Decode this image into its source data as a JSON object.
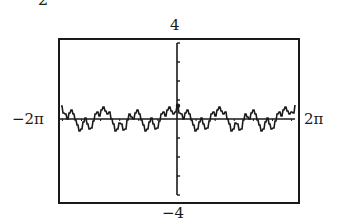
{
  "caption_fragment": "2",
  "labels": {
    "ymax": "4",
    "ymin": "−4",
    "xmin": "−2π",
    "xmax": "2π"
  },
  "colors": {
    "ink": "#1a1a1a",
    "background": "#ffffff"
  },
  "chart_data": {
    "type": "line",
    "title": "",
    "xlabel": "",
    "ylabel": "",
    "xlim": [
      -6.2832,
      6.2832
    ],
    "ylim": [
      -4,
      4
    ],
    "x_tick_labels": [
      "−2π",
      "2π"
    ],
    "y_tick_labels": [
      "−4",
      "4"
    ],
    "y_ticks": [
      -4,
      -3,
      -2,
      -1,
      0,
      1,
      2,
      3,
      4
    ],
    "grid": false,
    "legend": null,
    "style": "graphing-calculator pixel plot, periodic with period π",
    "series": [
      {
        "name": "f(x)",
        "x": [
          -6.07,
          -5.97,
          -5.86,
          -5.76,
          -5.65,
          -5.55,
          -5.44,
          -5.34,
          -5.23,
          -5.13,
          -5.02,
          -4.92,
          -4.81,
          -4.71,
          -4.6,
          -4.5,
          -4.39,
          -4.29,
          -4.19,
          -4.08,
          -3.98,
          -3.87,
          -3.77,
          -3.66,
          -3.56,
          -3.45,
          -3.35,
          -3.24,
          -3.14,
          -3.04,
          -2.93,
          -2.83,
          -2.72,
          -2.62,
          -2.51,
          -2.41,
          -2.3,
          -2.2,
          -2.09,
          -1.99,
          -1.88,
          -1.78,
          -1.68,
          -1.57,
          -1.47,
          -1.36,
          -1.26,
          -1.15,
          -1.05,
          -0.94,
          -0.84,
          -0.73,
          -0.63,
          -0.52,
          -0.42,
          -0.31,
          -0.21,
          -0.1,
          0.0,
          0.1,
          0.21,
          0.31,
          0.42,
          0.52,
          0.63,
          0.73,
          0.84,
          0.94,
          1.05,
          1.15,
          1.26,
          1.36,
          1.47,
          1.57,
          1.68,
          1.78,
          1.88,
          1.99,
          2.09,
          2.2,
          2.3,
          2.41,
          2.51,
          2.62,
          2.72,
          2.83,
          2.93,
          3.04,
          3.14,
          3.24,
          3.35,
          3.45,
          3.56,
          3.66,
          3.77,
          3.87,
          3.98,
          4.08,
          4.19,
          4.29,
          4.39,
          4.5,
          4.6,
          4.71,
          4.81,
          4.92,
          5.02,
          5.13,
          5.23,
          5.34,
          5.44,
          5.55,
          5.65,
          5.76,
          5.86,
          5.97,
          6.07,
          6.18
        ],
        "y": [
          0.7,
          0.3,
          0.25,
          0.0,
          0.3,
          0.45,
          0.25,
          -0.05,
          -0.3,
          -0.65,
          -0.5,
          -0.15,
          0.05,
          -0.25,
          -0.55,
          -0.45,
          -0.1,
          0.25,
          0.35,
          0.15,
          0.45,
          0.65,
          0.4,
          0.25,
          0.35,
          0.0,
          -0.25,
          -0.65,
          -0.5,
          -0.2,
          -0.25,
          -0.6,
          -0.5,
          -0.05,
          0.25,
          0.1,
          0.0,
          0.3,
          0.45,
          0.25,
          -0.05,
          -0.3,
          -0.65,
          -0.5,
          -0.15,
          0.05,
          -0.25,
          -0.55,
          -0.45,
          -0.1,
          0.25,
          0.35,
          0.15,
          0.45,
          0.65,
          0.4,
          0.25,
          0.35,
          0.7,
          0.3,
          0.25,
          0.0,
          0.3,
          0.45,
          0.25,
          -0.05,
          -0.3,
          -0.65,
          -0.5,
          -0.15,
          0.05,
          -0.25,
          -0.55,
          -0.45,
          -0.1,
          0.25,
          0.35,
          0.15,
          0.45,
          0.65,
          0.4,
          0.25,
          0.35,
          0.0,
          -0.25,
          -0.65,
          -0.5,
          -0.2,
          -0.25,
          -0.6,
          -0.5,
          -0.05,
          0.25,
          0.1,
          0.0,
          0.3,
          0.45,
          0.25,
          -0.05,
          -0.3,
          -0.65,
          -0.5,
          -0.15,
          0.05,
          -0.25,
          -0.55,
          -0.45,
          -0.1,
          0.25,
          0.35,
          0.15,
          0.45,
          0.65,
          0.4,
          0.25,
          0.35,
          0.3,
          0.75
        ]
      }
    ]
  }
}
